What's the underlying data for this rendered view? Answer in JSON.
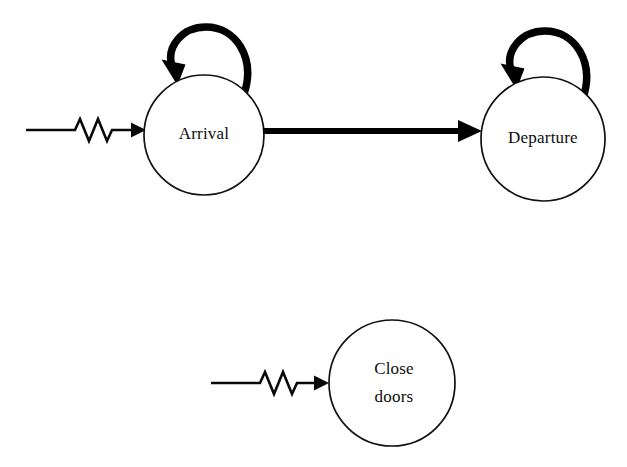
{
  "diagram": {
    "background_color": "#ffffff",
    "stroke_color": "#000000",
    "states": [
      {
        "id": "arrival",
        "label": "Arrival",
        "label_lines": [
          "Arrival"
        ],
        "cx": 204,
        "cy": 135,
        "r": 60
      },
      {
        "id": "departure",
        "label": "Departure",
        "label_lines": [
          "Departure"
        ],
        "cx": 543,
        "cy": 139,
        "r": 62
      },
      {
        "id": "close-doors",
        "label": "Close doors",
        "label_lines": [
          "Close",
          "doors"
        ],
        "cx": 392,
        "cy": 383,
        "r": 63
      }
    ],
    "self_loops": [
      {
        "id": "arrival-self-loop",
        "on_state": "arrival"
      },
      {
        "id": "departure-self-loop",
        "on_state": "departure"
      }
    ],
    "transitions": [
      {
        "id": "arrival-to-departure",
        "from": "arrival",
        "to": "departure",
        "style": "thick-solid",
        "label": ""
      }
    ],
    "entry_arrows": [
      {
        "id": "entry-arrival",
        "to": "arrival",
        "style": "zigzag",
        "label": ""
      },
      {
        "id": "entry-close-doors",
        "to": "close-doors",
        "style": "zigzag",
        "label": ""
      }
    ]
  }
}
